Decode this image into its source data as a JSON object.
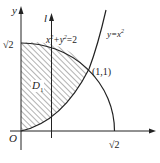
{
  "diagram": {
    "axes": {
      "x_label": "x",
      "y_label": "y",
      "origin_label": "O",
      "x_tick_label": "√2",
      "y_tick_label": "√2"
    },
    "line": {
      "label": "l"
    },
    "curves": {
      "circle_label_parts": [
        "x",
        "2",
        "+y",
        "2",
        "=2"
      ],
      "circle_equation": "x²+y²=2",
      "parabola_label_parts": [
        "y=x",
        "2"
      ],
      "parabola_equation": "y=x²"
    },
    "intersection_label": "(1,1)",
    "region_label": "D",
    "region_subscript": "1",
    "colors": {
      "stroke": "#222222",
      "hatch": "#555555",
      "background": "#ffffff"
    }
  }
}
